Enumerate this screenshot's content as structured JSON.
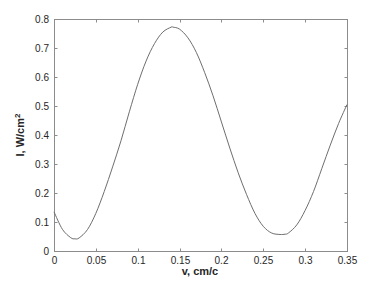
{
  "chart_data": {
    "type": "line",
    "title": "",
    "xlabel": "v, cm/c",
    "ylabel": "I, W/cm²",
    "ylabel_base": "I, W/cm",
    "ylabel_sup": "2",
    "xlim": [
      0,
      0.35
    ],
    "ylim": [
      0,
      0.8
    ],
    "xticks": [
      "0",
      "0.05",
      "0.1",
      "0.15",
      "0.2",
      "0.25",
      "0.3",
      "0.35"
    ],
    "yticks": [
      "0",
      "0.1",
      "0.2",
      "0.3",
      "0.4",
      "0.5",
      "0.6",
      "0.7",
      "0.8"
    ],
    "grid": false,
    "legend": null,
    "series": [
      {
        "name": "I(v)",
        "color": "#6e6e6e",
        "x": [
          0,
          0.01,
          0.02,
          0.025,
          0.03,
          0.04,
          0.05,
          0.06,
          0.07,
          0.08,
          0.09,
          0.1,
          0.11,
          0.12,
          0.13,
          0.14,
          0.142,
          0.15,
          0.16,
          0.17,
          0.18,
          0.19,
          0.2,
          0.21,
          0.22,
          0.23,
          0.24,
          0.25,
          0.26,
          0.27,
          0.276,
          0.28,
          0.29,
          0.3,
          0.31,
          0.32,
          0.33,
          0.34,
          0.35
        ],
        "y": [
          0.135,
          0.075,
          0.046,
          0.042,
          0.045,
          0.074,
          0.13,
          0.205,
          0.29,
          0.38,
          0.48,
          0.575,
          0.655,
          0.715,
          0.755,
          0.772,
          0.772,
          0.765,
          0.735,
          0.685,
          0.615,
          0.535,
          0.445,
          0.355,
          0.27,
          0.195,
          0.13,
          0.085,
          0.062,
          0.057,
          0.058,
          0.062,
          0.09,
          0.14,
          0.205,
          0.285,
          0.365,
          0.44,
          0.505
        ]
      }
    ]
  }
}
